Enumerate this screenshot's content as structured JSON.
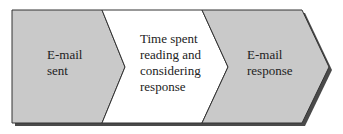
{
  "diagram": {
    "type": "process-flow",
    "steps": [
      {
        "label": "E-mail\nsent",
        "fill": "#c9c9c9"
      },
      {
        "label": "Time spent\nreading and\nconsidering\nresponse",
        "fill": "#ffffff"
      },
      {
        "label": "E-mail\nresponse",
        "fill": "#c9c9c9"
      }
    ],
    "colors": {
      "outline": "#333333",
      "shadow": "#4a4a4a",
      "text": "#222222"
    }
  }
}
